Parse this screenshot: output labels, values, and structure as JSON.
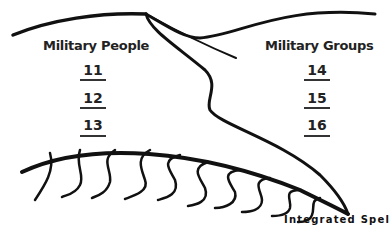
{
  "columns": [
    {
      "heading": "Military People",
      "items": [
        "11",
        "12",
        "13"
      ]
    },
    {
      "heading": "Military Groups",
      "items": [
        "14",
        "15",
        "16"
      ]
    }
  ],
  "footer": "Integrated Spel",
  "colors": {
    "ink": "#111111",
    "background": "#ffffff"
  }
}
